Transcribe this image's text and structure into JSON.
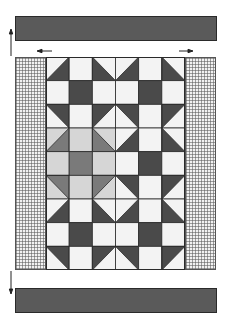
{
  "colors": {
    "band": "#5a5a5a",
    "light": "#f3f3f3",
    "light_gray": "#d6d6d6",
    "mid": "#7a7a7a",
    "dark": "#4a4a4a",
    "line": "#2a2a2a"
  },
  "grid": {
    "cols": 6,
    "rows": 9,
    "legend": "cell codes: L=light, G=light-gray, M=mid-gray square, D=dark square; HST codes 'shade:corner' where corner = BR/BL/TR/TL dark triangle half, light half in base",
    "cells": [
      [
        "D:BR",
        "L",
        "D:BL",
        "D:BR",
        "L",
        "D:BL"
      ],
      [
        "L",
        "D",
        "L",
        "L",
        "D",
        "L"
      ],
      [
        "D:TR",
        "L",
        "D:TL",
        "D:TR",
        "L",
        "D:TL"
      ],
      [
        "M:BR",
        "G",
        "M:BL",
        "D:BR",
        "L",
        "D:BL"
      ],
      [
        "G",
        "M",
        "G",
        "L",
        "D",
        "L"
      ],
      [
        "M:TR",
        "G",
        "M:TL",
        "D:TR",
        "L",
        "D:TL"
      ],
      [
        "D:BR",
        "L",
        "D:BL",
        "D:BR",
        "L",
        "D:BL"
      ],
      [
        "L",
        "D",
        "L",
        "L",
        "D",
        "L"
      ],
      [
        "D:TR",
        "L",
        "D:TL",
        "D:TR",
        "L",
        "D:TL"
      ]
    ]
  },
  "arrows": [
    {
      "name": "up-arrow-left",
      "direction": "up"
    },
    {
      "name": "left-arrow-top",
      "direction": "left"
    },
    {
      "name": "right-arrow-top",
      "direction": "right"
    },
    {
      "name": "down-arrow-left",
      "direction": "down"
    }
  ]
}
